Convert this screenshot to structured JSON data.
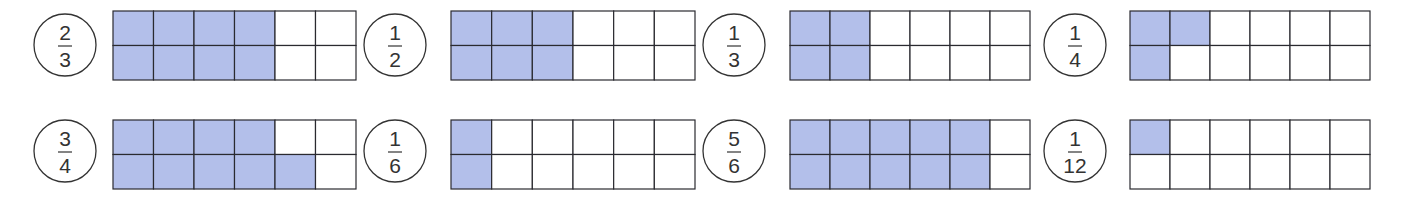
{
  "colors": {
    "filled": "#b3bfea",
    "empty": "#ffffff",
    "grid_line": "#2a2a30",
    "circle_line": "#333333",
    "text": "#333333"
  },
  "grid": {
    "rows": 2,
    "cols": 6
  },
  "items": [
    {
      "numerator": "2",
      "denominator": "3",
      "filled": [
        [
          1,
          1,
          1,
          1,
          0,
          0
        ],
        [
          1,
          1,
          1,
          1,
          0,
          0
        ]
      ]
    },
    {
      "numerator": "1",
      "denominator": "2",
      "filled": [
        [
          1,
          1,
          1,
          0,
          0,
          0
        ],
        [
          1,
          1,
          1,
          0,
          0,
          0
        ]
      ]
    },
    {
      "numerator": "1",
      "denominator": "3",
      "filled": [
        [
          1,
          1,
          0,
          0,
          0,
          0
        ],
        [
          1,
          1,
          0,
          0,
          0,
          0
        ]
      ]
    },
    {
      "numerator": "1",
      "denominator": "4",
      "filled": [
        [
          1,
          1,
          0,
          0,
          0,
          0
        ],
        [
          1,
          0,
          0,
          0,
          0,
          0
        ]
      ]
    },
    {
      "numerator": "3",
      "denominator": "4",
      "filled": [
        [
          1,
          1,
          1,
          1,
          0,
          0
        ],
        [
          1,
          1,
          1,
          1,
          1,
          0
        ]
      ]
    },
    {
      "numerator": "1",
      "denominator": "6",
      "filled": [
        [
          1,
          0,
          0,
          0,
          0,
          0
        ],
        [
          1,
          0,
          0,
          0,
          0,
          0
        ]
      ]
    },
    {
      "numerator": "5",
      "denominator": "6",
      "filled": [
        [
          1,
          1,
          1,
          1,
          1,
          0
        ],
        [
          1,
          1,
          1,
          1,
          1,
          0
        ]
      ]
    },
    {
      "numerator": "1",
      "denominator": "12",
      "filled": [
        [
          1,
          0,
          0,
          0,
          0,
          0
        ],
        [
          0,
          0,
          0,
          0,
          0,
          0
        ]
      ]
    }
  ]
}
